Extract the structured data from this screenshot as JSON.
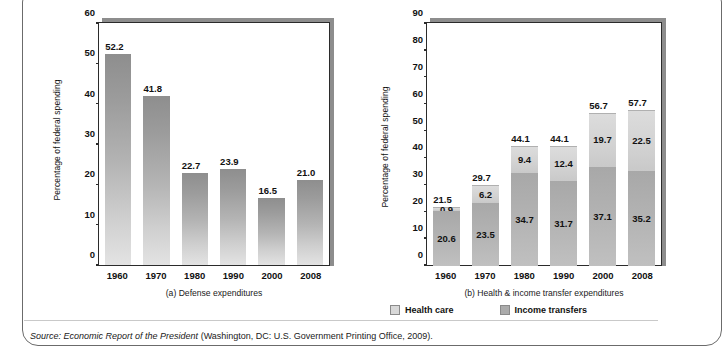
{
  "figure": {
    "source_prefix": "Source:",
    "source_italic": "Economic Report of the President",
    "source_rest": "(Washington, DC: U.S. Government Printing Office, 2009)."
  },
  "legend": {
    "items": [
      {
        "label": "Health care",
        "color": "#d8d8d8",
        "key": "health"
      },
      {
        "label": "Income transfers",
        "color": "#ababab",
        "key": "income"
      }
    ]
  },
  "chart_data": [
    {
      "id": "a",
      "type": "bar",
      "title": "(a) Defense expenditures",
      "xlabel": "",
      "ylabel": "Percentage of federal spending",
      "categories": [
        "1960",
        "1970",
        "1980",
        "1990",
        "2000",
        "2008"
      ],
      "values": [
        52.2,
        41.8,
        22.7,
        23.9,
        16.5,
        21.0
      ],
      "value_labels": [
        "52.2",
        "41.8",
        "22.7",
        "23.9",
        "16.5",
        "21.0"
      ],
      "ylim": [
        0,
        60
      ],
      "yticks": [
        0,
        10,
        20,
        30,
        40,
        50,
        60
      ],
      "ytick_labels": [
        "0",
        "10",
        "20",
        "30",
        "40",
        "50",
        "60"
      ],
      "grid": false,
      "legend_position": "none",
      "bar_color": "#b4b4b4"
    },
    {
      "id": "b",
      "type": "bar",
      "stacked": true,
      "title": "(b) Health & income transfer expenditures",
      "xlabel": "",
      "ylabel": "Percentage of federal spending",
      "categories": [
        "1960",
        "1970",
        "1980",
        "1990",
        "2000",
        "2008"
      ],
      "series": [
        {
          "name": "Income transfers",
          "color": "#ababab",
          "values": [
            20.6,
            23.5,
            34.7,
            31.7,
            37.1,
            35.2
          ],
          "value_labels": [
            "20.6",
            "23.5",
            "34.7",
            "31.7",
            "37.1",
            "35.2"
          ]
        },
        {
          "name": "Health care",
          "color": "#d8d8d8",
          "values": [
            0.9,
            6.2,
            9.4,
            12.4,
            19.7,
            22.5
          ],
          "value_labels": [
            "0.9",
            "6.2",
            "9.4",
            "12.4",
            "19.7",
            "22.5"
          ]
        }
      ],
      "totals": [
        21.5,
        29.7,
        44.1,
        44.1,
        56.7,
        57.7
      ],
      "total_labels": [
        "21.5",
        "29.7",
        "44.1",
        "44.1",
        "56.7",
        "57.7"
      ],
      "ylim": [
        0,
        90
      ],
      "yticks": [
        0,
        10,
        20,
        30,
        40,
        50,
        60,
        70,
        80,
        90
      ],
      "ytick_labels": [
        "0",
        "10",
        "20",
        "30",
        "40",
        "50",
        "60",
        "70",
        "80",
        "90"
      ],
      "grid": false,
      "legend_position": "below"
    }
  ]
}
